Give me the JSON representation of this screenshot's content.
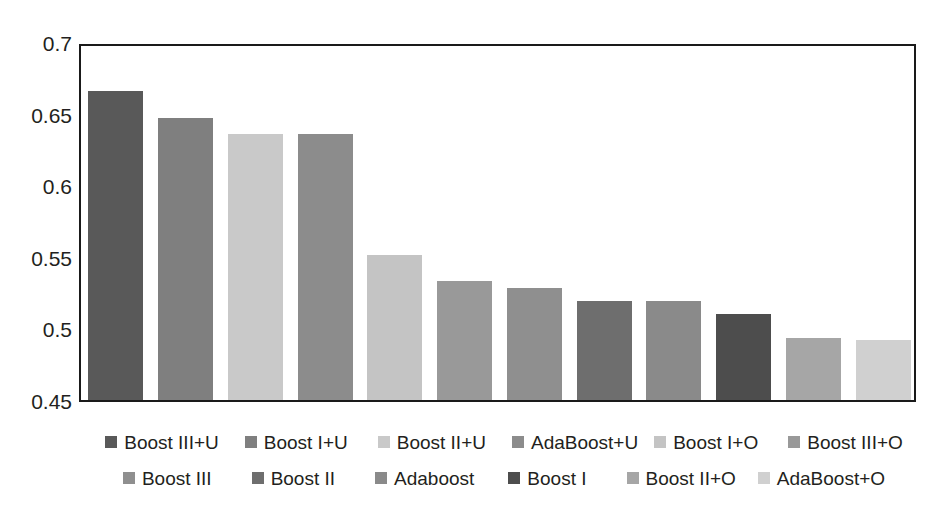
{
  "chart_data": {
    "type": "bar",
    "title": "",
    "subtitle": "",
    "xlabel": "",
    "ylabel": "",
    "ylim": [
      0.45,
      0.7
    ],
    "yticks": [
      "0.7",
      "0.65",
      "0.6",
      "0.55",
      "0.5",
      "0.45"
    ],
    "ytick_values": [
      0.7,
      0.65,
      0.6,
      0.55,
      0.5,
      0.45
    ],
    "grid": false,
    "legend_position": "bottom",
    "categories": [
      "Boost III+U",
      "Boost I+U",
      "Boost II+U",
      "AdaBoost+U",
      "Boost I+O",
      "Boost III+O",
      "Boost III",
      "Boost II",
      "Adaboost",
      "Boost I",
      "Boost II+O",
      "AdaBoost+O"
    ],
    "values": [
      0.666,
      0.647,
      0.636,
      0.636,
      0.551,
      0.533,
      0.528,
      0.519,
      0.519,
      0.51,
      0.493,
      0.492
    ],
    "colors": [
      "#595959",
      "#7f7f7f",
      "#c9c9c9",
      "#8c8c8c",
      "#c4c4c4",
      "#999999",
      "#8f8f8f",
      "#6e6e6e",
      "#8a8a8a",
      "#4d4d4d",
      "#a6a6a6",
      "#d0d0d0"
    ]
  },
  "legend": {
    "rows": [
      [
        {
          "label": "Boost III+U",
          "color": "#595959"
        },
        {
          "label": "Boost I+U",
          "color": "#7f7f7f"
        },
        {
          "label": "Boost II+U",
          "color": "#c9c9c9"
        },
        {
          "label": "AdaBoost+U",
          "color": "#8c8c8c"
        },
        {
          "label": "Boost I+O",
          "color": "#c4c4c4"
        },
        {
          "label": "Boost III+O",
          "color": "#999999"
        }
      ],
      [
        {
          "label": "Boost III",
          "color": "#8f8f8f"
        },
        {
          "label": "Boost II",
          "color": "#6e6e6e"
        },
        {
          "label": "Adaboost",
          "color": "#8a8a8a"
        },
        {
          "label": "Boost I",
          "color": "#4d4d4d"
        },
        {
          "label": "Boost II+O",
          "color": "#a6a6a6"
        },
        {
          "label": "AdaBoost+O",
          "color": "#d0d0d0"
        }
      ]
    ]
  }
}
